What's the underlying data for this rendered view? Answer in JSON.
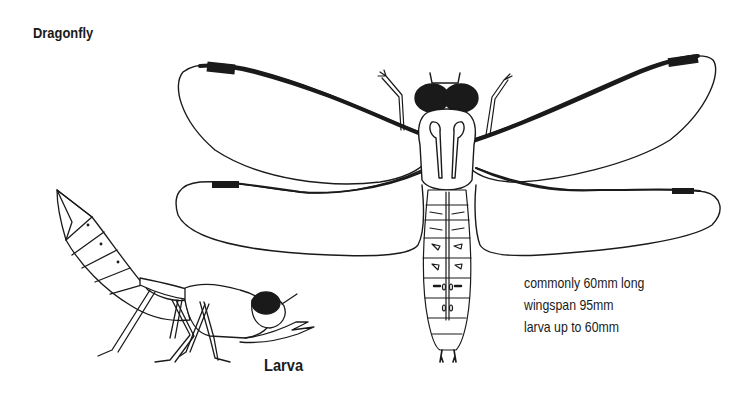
{
  "title": "Dragonfly",
  "larva_label": "Larva",
  "facts": [
    "commonly 60mm long",
    "wingspan 95mm",
    "larva up to 60mm"
  ],
  "colors": {
    "ink": "#1a1a1a",
    "background": "#ffffff"
  }
}
